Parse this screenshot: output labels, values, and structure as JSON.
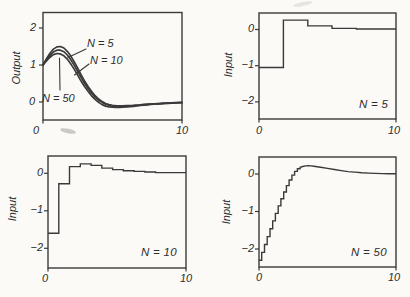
{
  "panels": {
    "output": {
      "ylabel": "Output",
      "yticks": [
        "2",
        "1",
        "0"
      ],
      "xtick_left": "0",
      "xtick_right": "10",
      "annotations": {
        "n5": "N = 5",
        "n10": "N = 10",
        "n50": "N = 50"
      }
    },
    "input_n5": {
      "ylabel": "Input",
      "yticks": [
        "0",
        "−1",
        "−2"
      ],
      "xtick_left": "0",
      "xtick_right": "10",
      "corner_label": "N = 5"
    },
    "input_n10": {
      "ylabel": "Input",
      "yticks": [
        "0",
        "−1",
        "−2"
      ],
      "xtick_left": "0",
      "xtick_right": "10",
      "corner_label": "N = 10"
    },
    "input_n50": {
      "ylabel": "Input",
      "yticks": [
        "0",
        "−1",
        "−2"
      ],
      "xtick_left": "0",
      "xtick_right": "10",
      "corner_label": "N = 50"
    }
  },
  "colors": {
    "line": "#3a3a3a",
    "text": "#2d2d2d",
    "background": "#fbfaf7"
  },
  "chart_data": [
    {
      "id": "output",
      "type": "line",
      "title": "",
      "xlabel": "",
      "ylabel": "Output",
      "xlim": [
        0,
        10
      ],
      "ylim": [
        -0.49,
        2.42
      ],
      "ytick_values": [
        2,
        1,
        0
      ],
      "xtick_values": [
        0,
        10
      ],
      "grid": false,
      "x_start": 0,
      "x_step": 0.25,
      "series": [
        {
          "name": "N = 5",
          "values": [
            1.0,
            1.17,
            1.32,
            1.43,
            1.49,
            1.5,
            1.46,
            1.37,
            1.24,
            1.08,
            0.91,
            0.73,
            0.56,
            0.41,
            0.28,
            0.17,
            0.08,
            0.01,
            -0.04,
            -0.07,
            -0.09,
            -0.1,
            -0.105,
            -0.105,
            -0.1,
            -0.095,
            -0.09,
            -0.08,
            -0.075,
            -0.065,
            -0.06,
            -0.055,
            -0.05,
            -0.042,
            -0.038,
            -0.032,
            -0.028,
            -0.024,
            -0.02,
            -0.016,
            -0.013
          ]
        },
        {
          "name": "N = 10",
          "values": [
            1.0,
            1.14,
            1.26,
            1.35,
            1.4,
            1.4,
            1.36,
            1.27,
            1.14,
            0.99,
            0.82,
            0.66,
            0.5,
            0.36,
            0.23,
            0.13,
            0.05,
            -0.01,
            -0.06,
            -0.09,
            -0.11,
            -0.12,
            -0.12,
            -0.12,
            -0.115,
            -0.11,
            -0.1,
            -0.095,
            -0.085,
            -0.075,
            -0.068,
            -0.06,
            -0.055,
            -0.048,
            -0.042,
            -0.036,
            -0.031,
            -0.026,
            -0.022,
            -0.018,
            -0.014
          ]
        },
        {
          "name": "N = 50",
          "values": [
            1.0,
            1.11,
            1.21,
            1.28,
            1.31,
            1.3,
            1.25,
            1.16,
            1.03,
            0.88,
            0.72,
            0.56,
            0.41,
            0.28,
            0.16,
            0.07,
            -0.01,
            -0.07,
            -0.11,
            -0.13,
            -0.14,
            -0.145,
            -0.145,
            -0.14,
            -0.135,
            -0.125,
            -0.115,
            -0.105,
            -0.095,
            -0.085,
            -0.075,
            -0.067,
            -0.06,
            -0.052,
            -0.046,
            -0.04,
            -0.034,
            -0.029,
            -0.024,
            -0.02,
            -0.016
          ]
        }
      ]
    },
    {
      "id": "input_n5",
      "type": "step",
      "title": "N = 5",
      "ylabel": "Input",
      "xlim": [
        0,
        10
      ],
      "ylim": [
        -2.5,
        0.44
      ],
      "ytick_values": [
        0,
        -1,
        -2
      ],
      "xtick_values": [
        0,
        10
      ],
      "grid": false,
      "step_t": [
        0,
        1.78,
        3.56,
        5.33,
        7.11
      ],
      "step_v": [
        -1.05,
        0.26,
        0.1,
        0.03,
        0.015
      ]
    },
    {
      "id": "input_n10",
      "type": "step",
      "title": "N = 10",
      "ylabel": "Input",
      "xlim": [
        0,
        10
      ],
      "ylim": [
        -2.5,
        0.46
      ],
      "ytick_values": [
        0,
        -1,
        -2
      ],
      "xtick_values": [
        0,
        10
      ],
      "grid": false,
      "step_t": [
        0,
        0.78,
        1.56,
        2.34,
        3.12,
        3.9,
        4.68,
        5.46,
        6.24,
        7.02,
        7.8
      ],
      "step_v": [
        -1.6,
        -0.28,
        0.18,
        0.25,
        0.21,
        0.14,
        0.1,
        0.07,
        0.05,
        0.035,
        0.02
      ]
    },
    {
      "id": "input_n50",
      "type": "step",
      "title": "N = 50",
      "ylabel": "Input",
      "xlim": [
        0,
        10
      ],
      "ylim": [
        -2.5,
        0.45
      ],
      "ytick_values": [
        0,
        -1,
        -2
      ],
      "xtick_values": [
        0,
        10
      ],
      "grid": false,
      "step_t": [
        0,
        0.2,
        0.4,
        0.6,
        0.8,
        1.0,
        1.2,
        1.4,
        1.6,
        1.8,
        2.0,
        2.2,
        2.4,
        2.6,
        2.8
      ],
      "step_v": [
        -2.3,
        -2.09,
        -1.88,
        -1.67,
        -1.46,
        -1.25,
        -1.05,
        -0.85,
        -0.66,
        -0.48,
        -0.31,
        -0.16,
        -0.03,
        0.07,
        0.14
      ],
      "tail_x": [
        3.0,
        3.2,
        3.4,
        3.6,
        3.8,
        4.0,
        4.5,
        5.0,
        5.5,
        6.0,
        6.5,
        7.0,
        7.5,
        8.0,
        8.5,
        9.0,
        9.5,
        10
      ],
      "tail_y": [
        0.18,
        0.2,
        0.215,
        0.22,
        0.215,
        0.205,
        0.18,
        0.15,
        0.12,
        0.09,
        0.065,
        0.05,
        0.035,
        0.025,
        0.017,
        0.012,
        0.008,
        0.005
      ]
    }
  ]
}
